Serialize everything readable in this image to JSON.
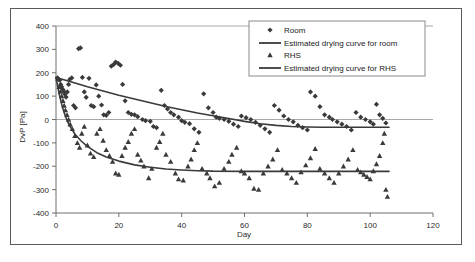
{
  "chart_data": {
    "type": "scatter",
    "title": "",
    "xlabel": "Day",
    "ylabel": "DvP [Pa]",
    "xlim": [
      0,
      120
    ],
    "ylim": [
      -400,
      400
    ],
    "xticks": [
      0,
      20,
      40,
      60,
      80,
      100,
      120
    ],
    "yticks": [
      400,
      300,
      200,
      100,
      0,
      -100,
      -200,
      -300,
      -400
    ],
    "grid": "horizontal-at-zero-and-top",
    "legend_position": "top-right",
    "legend": [
      {
        "label": "Room",
        "marker": "diamond",
        "type": "scatter"
      },
      {
        "label": "Estimated drying curve for room",
        "marker": "line",
        "type": "line"
      },
      {
        "label": "RHS",
        "marker": "triangle",
        "type": "scatter"
      },
      {
        "label": "Estimated drying curve for RHS",
        "marker": "line",
        "type": "line"
      }
    ],
    "series": [
      {
        "name": "Room",
        "marker": "diamond",
        "color": "#3a3a3a",
        "points": [
          [
            0.5,
            178
          ],
          [
            0.8,
            172
          ],
          [
            1.2,
            168
          ],
          [
            1.5,
            150
          ],
          [
            1.8,
            140
          ],
          [
            2.2,
            128
          ],
          [
            2.5,
            120
          ],
          [
            2.8,
            108
          ],
          [
            3.2,
            96
          ],
          [
            3.6,
            118
          ],
          [
            4.0,
            150
          ],
          [
            4.4,
            172
          ],
          [
            5.0,
            178
          ],
          [
            5.6,
            60
          ],
          [
            6.2,
            50
          ],
          [
            7.2,
            303
          ],
          [
            7.8,
            306
          ],
          [
            8.4,
            180
          ],
          [
            9.0,
            118
          ],
          [
            9.6,
            95
          ],
          [
            10.5,
            176
          ],
          [
            11.2,
            60
          ],
          [
            12.0,
            55
          ],
          [
            12.8,
            148
          ],
          [
            13.6,
            100
          ],
          [
            14.5,
            62
          ],
          [
            15.2,
            20
          ],
          [
            16.0,
            18
          ],
          [
            16.8,
            30
          ],
          [
            17.6,
            228
          ],
          [
            18.4,
            236
          ],
          [
            19.0,
            246
          ],
          [
            19.8,
            240
          ],
          [
            20.5,
            232
          ],
          [
            21.2,
            150
          ],
          [
            22.0,
            80
          ],
          [
            23.0,
            30
          ],
          [
            24.0,
            22
          ],
          [
            25.0,
            20
          ],
          [
            26.0,
            12
          ],
          [
            27.5,
            0
          ],
          [
            28.5,
            -5
          ],
          [
            30.0,
            -8
          ],
          [
            31.0,
            -30
          ],
          [
            32.0,
            -35
          ],
          [
            33.5,
            125
          ],
          [
            34.5,
            60
          ],
          [
            35.5,
            45
          ],
          [
            36.5,
            30
          ],
          [
            37.5,
            20
          ],
          [
            39.0,
            10
          ],
          [
            40.0,
            -5
          ],
          [
            41.0,
            -12
          ],
          [
            42.5,
            -18
          ],
          [
            44.0,
            -40
          ],
          [
            45.5,
            -55
          ],
          [
            47.0,
            110
          ],
          [
            48.5,
            50
          ],
          [
            50.0,
            30
          ],
          [
            51.0,
            10
          ],
          [
            52.0,
            5
          ],
          [
            53.5,
            0
          ],
          [
            55.0,
            -8
          ],
          [
            56.5,
            -20
          ],
          [
            58.0,
            -30
          ],
          [
            59.0,
            15
          ],
          [
            60.5,
            8
          ],
          [
            62.0,
            0
          ],
          [
            63.5,
            -12
          ],
          [
            65.0,
            -25
          ],
          [
            66.5,
            -40
          ],
          [
            68.0,
            -55
          ],
          [
            69.5,
            60
          ],
          [
            71.0,
            40
          ],
          [
            72.5,
            15
          ],
          [
            74.0,
            0
          ],
          [
            75.5,
            -10
          ],
          [
            77.0,
            -25
          ],
          [
            78.5,
            -35
          ],
          [
            80.0,
            -45
          ],
          [
            81.0,
            118
          ],
          [
            82.5,
            100
          ],
          [
            84.0,
            55
          ],
          [
            85.5,
            20
          ],
          [
            87.0,
            10
          ],
          [
            88.0,
            0
          ],
          [
            89.5,
            -10
          ],
          [
            91.0,
            -20
          ],
          [
            92.5,
            -30
          ],
          [
            94.0,
            -45
          ],
          [
            95.5,
            30
          ],
          [
            97.0,
            10
          ],
          [
            98.5,
            0
          ],
          [
            100.0,
            -10
          ],
          [
            101.0,
            -20
          ],
          [
            102.0,
            65
          ],
          [
            103.0,
            20
          ],
          [
            104.0,
            5
          ],
          [
            105.0,
            -15
          ]
        ]
      },
      {
        "name": "RHS",
        "marker": "triangle",
        "color": "#3a3a3a",
        "points": [
          [
            0.6,
            175
          ],
          [
            1.0,
            140
          ],
          [
            1.4,
            120
          ],
          [
            1.8,
            100
          ],
          [
            2.2,
            80
          ],
          [
            2.6,
            60
          ],
          [
            3.0,
            40
          ],
          [
            3.5,
            20
          ],
          [
            4.0,
            0
          ],
          [
            4.5,
            -20
          ],
          [
            5.2,
            -40
          ],
          [
            6.0,
            -70
          ],
          [
            6.8,
            -100
          ],
          [
            7.5,
            -120
          ],
          [
            8.2,
            -60
          ],
          [
            9.0,
            -30
          ],
          [
            10.0,
            -110
          ],
          [
            11.0,
            -145
          ],
          [
            12.0,
            -160
          ],
          [
            13.0,
            -60
          ],
          [
            14.0,
            -40
          ],
          [
            15.0,
            -90
          ],
          [
            16.0,
            -130
          ],
          [
            17.0,
            -155
          ],
          [
            18.0,
            -180
          ],
          [
            19.0,
            -230
          ],
          [
            20.0,
            -235
          ],
          [
            21.0,
            -155
          ],
          [
            22.0,
            -120
          ],
          [
            23.0,
            -95
          ],
          [
            24.0,
            -60
          ],
          [
            25.0,
            -40
          ],
          [
            26.0,
            -150
          ],
          [
            27.0,
            -175
          ],
          [
            28.0,
            -200
          ],
          [
            29.5,
            -250
          ],
          [
            30.5,
            -210
          ],
          [
            32.0,
            -120
          ],
          [
            33.0,
            -95
          ],
          [
            34.0,
            -60
          ],
          [
            35.0,
            -150
          ],
          [
            36.5,
            -180
          ],
          [
            38.0,
            -230
          ],
          [
            39.0,
            -255
          ],
          [
            40.5,
            -260
          ],
          [
            42.0,
            -200
          ],
          [
            43.0,
            -170
          ],
          [
            44.0,
            -130
          ],
          [
            45.0,
            -100
          ],
          [
            46.5,
            -210
          ],
          [
            48.0,
            -230
          ],
          [
            49.0,
            -250
          ],
          [
            50.5,
            -285
          ],
          [
            52.0,
            -270
          ],
          [
            53.5,
            -210
          ],
          [
            55.0,
            -180
          ],
          [
            56.0,
            -150
          ],
          [
            57.5,
            -120
          ],
          [
            59.0,
            -220
          ],
          [
            60.0,
            -230
          ],
          [
            61.5,
            -250
          ],
          [
            63.0,
            -295
          ],
          [
            64.5,
            -300
          ],
          [
            66.0,
            -230
          ],
          [
            67.5,
            -200
          ],
          [
            69.0,
            -170
          ],
          [
            70.5,
            -130
          ],
          [
            72.0,
            -215
          ],
          [
            73.5,
            -230
          ],
          [
            75.0,
            -250
          ],
          [
            76.5,
            -270
          ],
          [
            78.0,
            -225
          ],
          [
            79.5,
            -195
          ],
          [
            81.0,
            -165
          ],
          [
            82.5,
            -125
          ],
          [
            84.0,
            -210
          ],
          [
            85.5,
            -230
          ],
          [
            87.0,
            -250
          ],
          [
            88.5,
            -270
          ],
          [
            90.0,
            -230
          ],
          [
            91.5,
            -200
          ],
          [
            93.0,
            -170
          ],
          [
            94.5,
            -130
          ],
          [
            96.0,
            -215
          ],
          [
            97.0,
            -225
          ],
          [
            98.0,
            -235
          ],
          [
            99.0,
            -245
          ],
          [
            100.0,
            -255
          ],
          [
            101.0,
            -220
          ],
          [
            102.0,
            -190
          ],
          [
            103.0,
            -155
          ],
          [
            104.0,
            -100
          ],
          [
            104.5,
            -60
          ],
          [
            105.0,
            -300
          ],
          [
            105.5,
            -330
          ]
        ]
      }
    ],
    "curves": [
      {
        "name": "Estimated drying curve for room",
        "color": "#3a3a3a",
        "points": [
          [
            0.0,
            180
          ],
          [
            5.0,
            160
          ],
          [
            10.0,
            140
          ],
          [
            15.0,
            122
          ],
          [
            20.0,
            104
          ],
          [
            25.0,
            88
          ],
          [
            30.0,
            72
          ],
          [
            35.0,
            56
          ],
          [
            40.0,
            42
          ],
          [
            45.0,
            28
          ],
          [
            50.0,
            16
          ],
          [
            55.0,
            4
          ],
          [
            60.0,
            -8
          ],
          [
            65.0,
            -18
          ],
          [
            70.0,
            -25
          ],
          [
            75.0,
            -30
          ],
          [
            80.0,
            -32
          ],
          [
            85.0,
            -33
          ],
          [
            90.0,
            -33
          ],
          [
            95.0,
            -33
          ],
          [
            100.0,
            -33
          ],
          [
            106.0,
            -33
          ]
        ]
      },
      {
        "name": "Estimated drying curve for RHS",
        "color": "#3a3a3a",
        "points": [
          [
            0.0,
            180
          ],
          [
            1.0,
            110
          ],
          [
            2.0,
            55
          ],
          [
            3.0,
            14
          ],
          [
            4.0,
            -18
          ],
          [
            6.0,
            -62
          ],
          [
            8.0,
            -92
          ],
          [
            10.0,
            -115
          ],
          [
            13.0,
            -142
          ],
          [
            16.0,
            -160
          ],
          [
            20.0,
            -178
          ],
          [
            25.0,
            -194
          ],
          [
            30.0,
            -204
          ],
          [
            35.0,
            -212
          ],
          [
            40.0,
            -216
          ],
          [
            45.0,
            -219
          ],
          [
            50.0,
            -221
          ],
          [
            60.0,
            -222
          ],
          [
            70.0,
            -222
          ],
          [
            80.0,
            -222
          ],
          [
            90.0,
            -222
          ],
          [
            100.0,
            -222
          ],
          [
            106.0,
            -222
          ]
        ]
      }
    ]
  }
}
